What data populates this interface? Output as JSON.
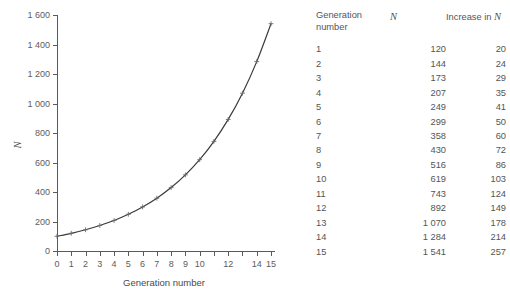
{
  "chart_data": {
    "type": "line",
    "title": "",
    "xlabel": "Generation number",
    "ylabel": "N",
    "xlim": [
      0,
      15
    ],
    "ylim": [
      0,
      1600
    ],
    "grid": false,
    "legend": false,
    "x_ticks": [
      0,
      1,
      2,
      3,
      4,
      5,
      6,
      7,
      8,
      9,
      10,
      11,
      12,
      13,
      14,
      15
    ],
    "x_tick_labels": [
      "0",
      "1",
      "2",
      "3",
      "4",
      "5",
      "6",
      "7",
      "8",
      "9",
      "10",
      "",
      "12",
      "",
      "14",
      "15"
    ],
    "y_ticks": [
      0,
      200,
      400,
      600,
      800,
      1000,
      1200,
      1400,
      1600
    ],
    "y_tick_labels": [
      "0",
      "200",
      "400",
      "600",
      "800",
      "1 000",
      "1 200",
      "1 400",
      "1 600"
    ],
    "x": [
      0,
      1,
      2,
      3,
      4,
      5,
      6,
      7,
      8,
      9,
      10,
      11,
      12,
      13,
      14,
      15
    ],
    "values": [
      100,
      120,
      144,
      173,
      207,
      249,
      299,
      358,
      430,
      516,
      619,
      743,
      892,
      1070,
      1284,
      1541
    ],
    "marker": "plus",
    "line_color": "#3a3a3a"
  },
  "table": {
    "headers": {
      "generation": "Generation number",
      "generation_line1": "Generation",
      "generation_line2": "number",
      "n": "N",
      "increase_prefix": "Increase in ",
      "increase_symbol": "N"
    },
    "rows": [
      {
        "generation": "1",
        "n": "120",
        "increase": "20"
      },
      {
        "generation": "2",
        "n": "144",
        "increase": "24"
      },
      {
        "generation": "3",
        "n": "173",
        "increase": "29"
      },
      {
        "generation": "4",
        "n": "207",
        "increase": "35"
      },
      {
        "generation": "5",
        "n": "249",
        "increase": "41"
      },
      {
        "generation": "6",
        "n": "299",
        "increase": "50"
      },
      {
        "generation": "7",
        "n": "358",
        "increase": "60"
      },
      {
        "generation": "8",
        "n": "430",
        "increase": "72"
      },
      {
        "generation": "9",
        "n": "516",
        "increase": "86"
      },
      {
        "generation": "10",
        "n": "619",
        "increase": "103"
      },
      {
        "generation": "11",
        "n": "743",
        "increase": "124"
      },
      {
        "generation": "12",
        "n": "892",
        "increase": "149"
      },
      {
        "generation": "13",
        "n": "1 070",
        "increase": "178"
      },
      {
        "generation": "14",
        "n": "1 284",
        "increase": "214"
      },
      {
        "generation": "15",
        "n": "1 541",
        "increase": "257"
      }
    ]
  },
  "colors": {
    "background": "#ffffff",
    "text": "#555555",
    "axis": "#5a5a5a",
    "curve": "#3a3a3a"
  }
}
